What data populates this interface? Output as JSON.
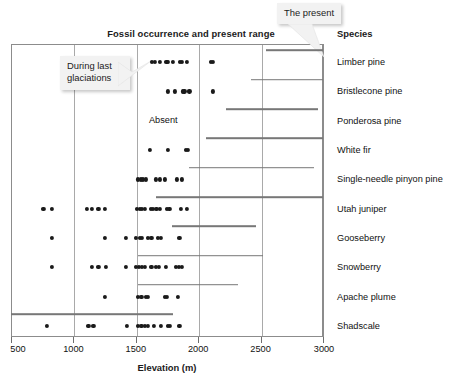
{
  "titles": {
    "chart_title": "Fossil occurrence and present range",
    "species_column": "Species",
    "x_axis": "Elevation (m)"
  },
  "callouts": [
    {
      "name": "the-present",
      "text": "The present"
    },
    {
      "name": "during-last-glaciations",
      "text": "During last\nglaciations"
    }
  ],
  "annotations": [
    {
      "name": "absent-label",
      "text": "Absent",
      "elevation": 1720
    }
  ],
  "chart_data": {
    "type": "scatter",
    "title": "Fossil occurrence and present range",
    "xlabel": "Elevation (m)",
    "ylabel": "Species",
    "xlim": [
      500,
      3000
    ],
    "xticks": [
      500,
      1000,
      1500,
      2000,
      2500,
      3000
    ],
    "xticklabels": [
      "500",
      "1000",
      "1500",
      "2000",
      "2500",
      "3000"
    ],
    "grid": "vertical",
    "legend": "none",
    "series": [
      {
        "name": "fossil-occurrence",
        "marker": "filled circle",
        "color": "#1a1a1a"
      },
      {
        "name": "present-range",
        "marker": "horizontal line",
        "color": "#777777"
      }
    ],
    "categories": [
      "Limber pine",
      "Bristlecone pine",
      "Ponderosa pine",
      "White fir",
      "Single-needle pinyon pine",
      "Utah juniper",
      "Gooseberry",
      "Snowberry",
      "Apache plume",
      "Shadscale"
    ],
    "rows": [
      {
        "species": "Limber pine",
        "fossils": [
          1630,
          1650,
          1690,
          1745,
          1760,
          1800,
          1855,
          1870,
          1910,
          2100,
          2120
        ],
        "present_range": [
          2540,
          3000
        ]
      },
      {
        "species": "Bristlecone pine",
        "fossils": [
          1760,
          1815,
          1875,
          1890,
          1930,
          2120
        ],
        "present_range": [
          2420,
          3000
        ]
      },
      {
        "species": "Ponderosa pine",
        "fossils": [],
        "present_range": [
          2220,
          2960
        ]
      },
      {
        "species": "White fir",
        "fossils": [
          1610,
          1760,
          1900,
          1920
        ],
        "present_range": [
          2060,
          3000
        ]
      },
      {
        "species": "Single-needle pinyon pine",
        "fossils": [
          1520,
          1540,
          1560,
          1580,
          1660,
          1690,
          1730,
          1830,
          1870
        ],
        "present_range": [
          1930,
          2930
        ]
      },
      {
        "species": "Utah juniper",
        "fossils": [
          760,
          830,
          1110,
          1150,
          1200,
          1250,
          1510,
          1530,
          1550,
          1570,
          1620,
          1640,
          1665,
          1690,
          1750,
          1770,
          1860,
          1910
        ],
        "present_range": [
          1660,
          3000
        ]
      },
      {
        "species": "Gooseberry",
        "fossils": [
          830,
          1250,
          1420,
          1500,
          1530,
          1550,
          1600,
          1625,
          1680,
          1700,
          1850
        ],
        "present_range": [
          1790,
          2460
        ]
      },
      {
        "species": "Snowberry",
        "fossils": [
          830,
          1150,
          1200,
          1260,
          1420,
          1500,
          1525,
          1550,
          1575,
          1625,
          1660,
          1685,
          1740,
          1820,
          1845,
          1870
        ],
        "present_range": [
          1520,
          2520
        ]
      },
      {
        "species": "Apache plume",
        "fossils": [
          1250,
          1520,
          1545,
          1580,
          1600,
          1730,
          1750,
          1840
        ],
        "present_range": [
          1520,
          2320
        ]
      },
      {
        "species": "Shadscale",
        "fossils": [
          790,
          1120,
          1160,
          1430,
          1520,
          1545,
          1570,
          1595,
          1645,
          1700,
          1755,
          1775,
          1850
        ],
        "present_range": [
          500,
          1800
        ]
      }
    ]
  }
}
